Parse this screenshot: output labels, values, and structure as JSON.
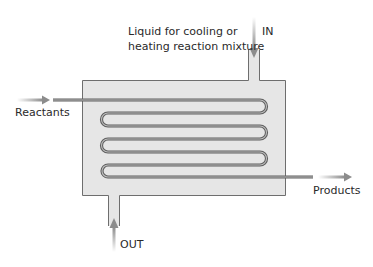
{
  "diagram": {
    "labels": {
      "coolant_line1": "Liquid for cooling or",
      "coolant_line2": "heating reaction mixture",
      "inlet": "IN",
      "outlet": "OUT",
      "reactants": "Reactants",
      "products": "Products"
    },
    "colors": {
      "vessel_fill": "#e6e6e6",
      "vessel_stroke": "#6e6e6e",
      "tube_stroke": "#5f5f5f",
      "tube_inner": "#bdbdbd",
      "arrow": "#8c8c8c",
      "text": "#2a2a2a"
    }
  }
}
